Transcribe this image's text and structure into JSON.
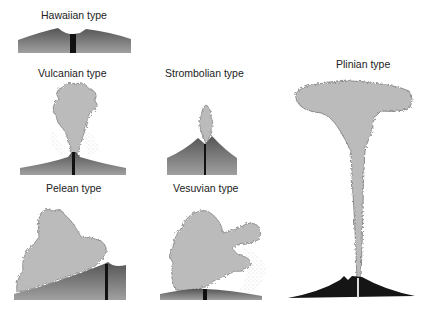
{
  "diagram": {
    "types": [
      {
        "id": "hawaiian",
        "label": "Hawaiian type"
      },
      {
        "id": "vulcanian",
        "label": "Vulcanian type"
      },
      {
        "id": "strombolian",
        "label": "Strombolian type"
      },
      {
        "id": "plinian",
        "label": "Plinian type"
      },
      {
        "id": "pelean",
        "label": "Pelean type"
      },
      {
        "id": "vesuvian",
        "label": "Vesuvian type"
      }
    ],
    "colors": {
      "ground_dark": "#555555",
      "ground_light": "#9a9a9a",
      "conduit": "#111111",
      "cloud_fill": "#b8b8b8",
      "cloud_stroke": "#6f6f6f",
      "ash_dots": "#dcdcdc",
      "plinian_ground": "#151515"
    }
  }
}
